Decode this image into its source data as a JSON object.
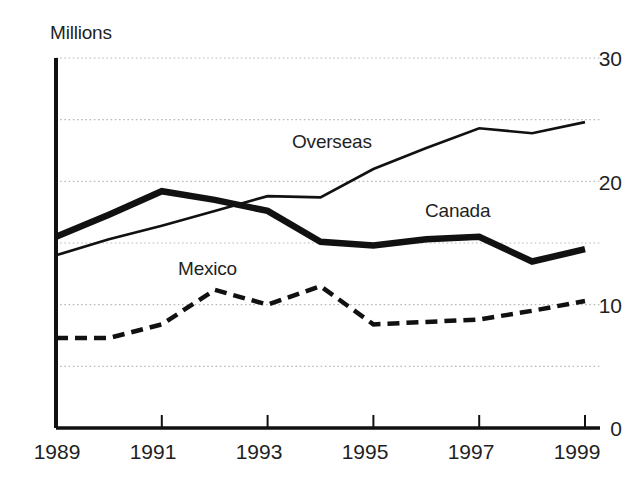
{
  "chart_data": {
    "type": "line",
    "title": "",
    "ylabel": "Millions",
    "xlabel": "",
    "x": [
      1989,
      1990,
      1991,
      1992,
      1993,
      1994,
      1995,
      1996,
      1997,
      1998,
      1999
    ],
    "xlim": [
      1989,
      1999
    ],
    "ylim": [
      0,
      30
    ],
    "y_ticks": [
      0,
      10,
      20,
      30
    ],
    "y_tick_labels": [
      "0",
      "10",
      "20",
      "30"
    ],
    "x_ticks": [
      1989,
      1991,
      1993,
      1995,
      1997,
      1999
    ],
    "x_tick_labels": [
      "1989",
      "1991",
      "1993",
      "1995",
      "1997",
      "1999"
    ],
    "gridlines": [
      5,
      10,
      15,
      20,
      25,
      30
    ],
    "grid": true,
    "grid_style": "dotted",
    "legend": "inline-annotations",
    "series": [
      {
        "name": "Canada",
        "style": "thick-solid",
        "color": "#111111",
        "values": [
          15.5,
          17.3,
          19.2,
          18.5,
          17.6,
          15.1,
          14.8,
          15.3,
          15.5,
          13.5,
          14.5
        ]
      },
      {
        "name": "Overseas",
        "style": "thin-solid",
        "color": "#111111",
        "values": [
          14.0,
          15.3,
          16.4,
          17.6,
          18.8,
          18.7,
          21.0,
          22.7,
          24.3,
          23.9,
          24.8
        ]
      },
      {
        "name": "Mexico",
        "style": "dashed",
        "color": "#111111",
        "values": [
          7.3,
          7.3,
          8.4,
          11.2,
          10.0,
          11.5,
          8.4,
          8.6,
          8.8,
          9.5,
          10.3
        ]
      }
    ],
    "annotations": [
      {
        "text": "Overseas",
        "x": 1993.4,
        "y": 22.0
      },
      {
        "text": "Canada",
        "x": 1995.9,
        "y": 17.6
      },
      {
        "text": "Mexico",
        "x": 1991.3,
        "y": 12.6
      }
    ]
  },
  "axis": {
    "title": "Millions",
    "y_labels": [
      "30",
      "20",
      "10",
      "0"
    ],
    "x_labels": [
      "1989",
      "1991",
      "1993",
      "1995",
      "1997",
      "1999"
    ]
  },
  "labels": {
    "overseas": "Overseas",
    "canada": "Canada",
    "mexico": "Mexico"
  },
  "colors": {
    "ink": "#111111",
    "grid": "#b9b9b9",
    "background": "#ffffff"
  }
}
